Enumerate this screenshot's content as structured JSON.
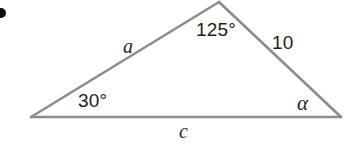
{
  "figure": {
    "type": "triangle-diagram",
    "background_color": "#ffffff",
    "stroke_color": "#8c8c8c",
    "stroke_width": 2.6,
    "text_color": "#1c1c1c",
    "vertices": {
      "left": {
        "x": 31,
        "y": 117
      },
      "apex": {
        "x": 219,
        "y": 2
      },
      "right": {
        "x": 341,
        "y": 117
      }
    },
    "marker": {
      "name": "bullet-dot",
      "color": "#0d0d0d",
      "x": 1,
      "y": 13,
      "radius": 5
    }
  },
  "labels": {
    "angle_apex": "125°",
    "angle_left": "30°",
    "angle_right": "α",
    "side_left": "a",
    "side_right": "10",
    "side_bottom": "c"
  }
}
